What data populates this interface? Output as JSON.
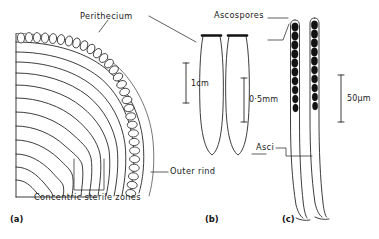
{
  "figure": {
    "type": "scientific-illustration",
    "background_color": "#ffffff",
    "ink_color": "#1a1a1a"
  },
  "labels": {
    "perithecium": "Perithecium",
    "outer_rind": "Outer rind",
    "concentric_sterile_zones": "Concentric sterile zones",
    "ascospores": "Ascospores",
    "asci": "Asci"
  },
  "scale_bars": [
    {
      "id": "scale-a",
      "text": "1cm",
      "panel": "a"
    },
    {
      "id": "scale-b",
      "text": "0·5mm",
      "panel": "b"
    },
    {
      "id": "scale-c",
      "text": "50μm",
      "panel": "c"
    }
  ],
  "panels": [
    {
      "id": "a",
      "label": "(a)",
      "caption": "Stroma section with perithecia, outer rind and concentric sterile zones"
    },
    {
      "id": "b",
      "label": "(b)",
      "caption": "Two club-shaped asci"
    },
    {
      "id": "c",
      "label": "(c)",
      "caption": "Two asci containing chains of dark ascospores"
    }
  ]
}
